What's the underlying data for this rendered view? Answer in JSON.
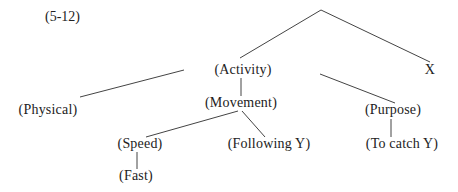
{
  "caption": "(5-12)",
  "nodes": {
    "root": {
      "label": ""
    },
    "activity": {
      "label": "(Activity)"
    },
    "x": {
      "label": "X"
    },
    "physical": {
      "label": "(Physical)"
    },
    "movement": {
      "label": "(Movement)"
    },
    "purpose": {
      "label": "(Purpose)"
    },
    "speed": {
      "label": "(Speed)"
    },
    "following_y": {
      "label": "(Following Y)"
    },
    "to_catch_y": {
      "label": "(To catch Y)"
    },
    "fast": {
      "label": "(Fast)"
    }
  },
  "edges": [
    [
      "root",
      "activity"
    ],
    [
      "root",
      "x"
    ],
    [
      "activity",
      "physical"
    ],
    [
      "activity",
      "movement"
    ],
    [
      "activity",
      "purpose"
    ],
    [
      "movement",
      "speed"
    ],
    [
      "movement",
      "following_y"
    ],
    [
      "purpose",
      "to_catch_y"
    ],
    [
      "speed",
      "fast"
    ]
  ]
}
